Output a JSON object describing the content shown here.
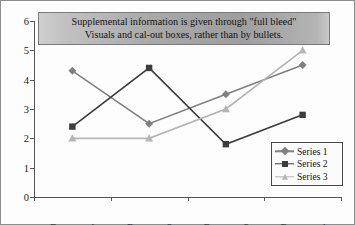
{
  "callout": {
    "line1": "Supplemental information is given through \"full bleed\"",
    "line2": "Visuals and cal-out boxes, rather than by bullets."
  },
  "legend": {
    "items": [
      {
        "label": "Series 1",
        "marker": "diamond-marker",
        "color": "#808080"
      },
      {
        "label": "Series 2",
        "marker": "square-marker",
        "color": "#3c3c3c"
      },
      {
        "label": "Series 3",
        "marker": "triangle-marker",
        "color": "#b5b5b5"
      }
    ]
  },
  "chart_data": {
    "type": "line",
    "title": "",
    "xlabel": "",
    "ylabel": "",
    "categories": [
      "Category 1",
      "Category 2",
      "Category 3",
      "Category 4"
    ],
    "ylim": [
      0,
      6
    ],
    "yticks": [
      0,
      1,
      2,
      3,
      4,
      5,
      6
    ],
    "ytick_labels": [
      "0",
      "1",
      "2",
      "3",
      "4",
      "5",
      "6"
    ],
    "grid": false,
    "legend_position": "lower-right",
    "series": [
      {
        "name": "Series 1",
        "values": [
          4.3,
          2.5,
          3.5,
          4.5
        ],
        "color": "#808080",
        "marker": "diamond"
      },
      {
        "name": "Series 2",
        "values": [
          2.4,
          4.4,
          1.8,
          2.8
        ],
        "color": "#3c3c3c",
        "marker": "square"
      },
      {
        "name": "Series 3",
        "values": [
          2.0,
          2.0,
          3.0,
          5.0
        ],
        "color": "#b5b5b5",
        "marker": "triangle"
      }
    ]
  }
}
